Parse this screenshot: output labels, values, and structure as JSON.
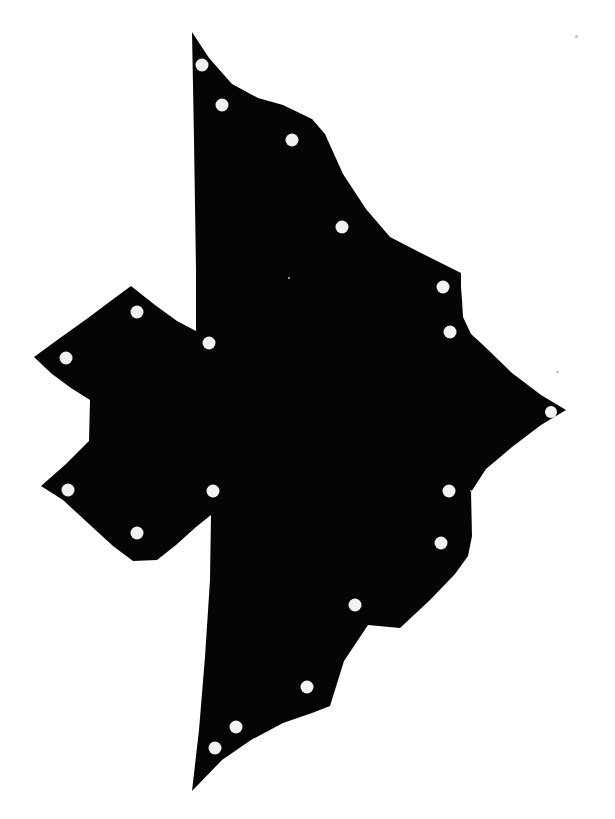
{
  "figure": {
    "canvas_width": 615,
    "canvas_height": 819,
    "background_color": "#ffffff",
    "part_fill_color": "#050505",
    "hole_fill_color": "#f2f2f2",
    "hole_radius": 6.5
  },
  "part": {
    "name": "irregular-plate-silhouette",
    "outline_points": "192,32 209,58 232,84 258,98 283,105 312,119 325,134 343,174 366,209 390,237 419,252 461,273 461,287 462,300 463,317 471,334 482,344 512,373 541,395 566,410 541,425 512,447 486,469 471,492 472,536 468,556 455,574 430,600 400,628 368,625 344,661 330,706 312,713 283,723 251,740 222,760 192,791 199,730 205,657 210,580 211,515 196,527 176,545 157,560 133,561 113,546 89,524 63,500 41,486 66,464 89,441 90,400 71,388 52,374 34,357 60,338 88,318 112,300 131,286 155,305 177,321 196,331 196,270 195,205 194,140 193,86",
    "holes": [
      {
        "id": "hole-1",
        "cx": 202,
        "cy": 65,
        "r": 6.5
      },
      {
        "id": "hole-2",
        "cx": 222,
        "cy": 105,
        "r": 6.5
      },
      {
        "id": "hole-3",
        "cx": 292,
        "cy": 140,
        "r": 6.5
      },
      {
        "id": "hole-4",
        "cx": 342,
        "cy": 227,
        "r": 6.5
      },
      {
        "id": "hole-5",
        "cx": 443,
        "cy": 287,
        "r": 6.5
      },
      {
        "id": "hole-6",
        "cx": 450,
        "cy": 332,
        "r": 6.5
      },
      {
        "id": "hole-7",
        "cx": 551,
        "cy": 412,
        "r": 6.0
      },
      {
        "id": "hole-8",
        "cx": 209,
        "cy": 343,
        "r": 6.5
      },
      {
        "id": "hole-9",
        "cx": 137,
        "cy": 312,
        "r": 6.5
      },
      {
        "id": "hole-10",
        "cx": 66,
        "cy": 358,
        "r": 6.5
      },
      {
        "id": "hole-11",
        "cx": 68,
        "cy": 490,
        "r": 6.5
      },
      {
        "id": "hole-12",
        "cx": 137,
        "cy": 533,
        "r": 6.5
      },
      {
        "id": "hole-13",
        "cx": 213,
        "cy": 491,
        "r": 6.5
      },
      {
        "id": "hole-14",
        "cx": 449,
        "cy": 491,
        "r": 6.5
      },
      {
        "id": "hole-15",
        "cx": 441,
        "cy": 543,
        "r": 6.5
      },
      {
        "id": "hole-16",
        "cx": 355,
        "cy": 605,
        "r": 6.5
      },
      {
        "id": "hole-17",
        "cx": 307,
        "cy": 687,
        "r": 6.5
      },
      {
        "id": "hole-18",
        "cx": 236,
        "cy": 727,
        "r": 6.5
      },
      {
        "id": "hole-19",
        "cx": 215,
        "cy": 748,
        "r": 6.5
      }
    ]
  },
  "artifacts": {
    "specks": [
      {
        "x": 575,
        "y": 35,
        "w": 3,
        "h": 3
      },
      {
        "x": 556,
        "y": 371,
        "w": 3,
        "h": 2
      },
      {
        "x": 288,
        "y": 277,
        "w": 2,
        "h": 2
      },
      {
        "x": 470,
        "y": 490,
        "w": 2,
        "h": 2
      }
    ]
  }
}
